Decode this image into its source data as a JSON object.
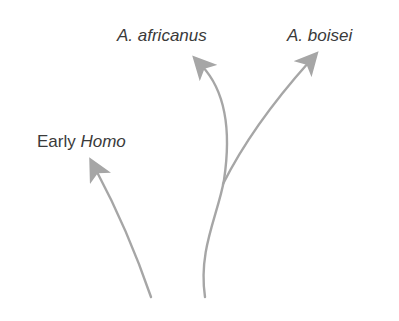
{
  "diagram": {
    "type": "phylogenetic-branching",
    "line_color": "#a6a6a6",
    "text_color": "#3a3a3a",
    "labels": {
      "africanus": {
        "prefix": "",
        "italic": "A. africanus"
      },
      "boisei": {
        "prefix": "",
        "italic": "A. boisei"
      },
      "homo": {
        "prefix": "Early ",
        "italic": "Homo"
      }
    },
    "branches": [
      {
        "name": "A. africanus",
        "from": [
          205,
          297
        ],
        "to": [
          196,
          55
        ]
      },
      {
        "name": "A. boisei",
        "from": [
          223,
          184
        ],
        "to": [
          315,
          53
        ]
      },
      {
        "name": "Early Homo",
        "from": [
          151,
          297
        ],
        "to": [
          91,
          159
        ]
      }
    ]
  }
}
